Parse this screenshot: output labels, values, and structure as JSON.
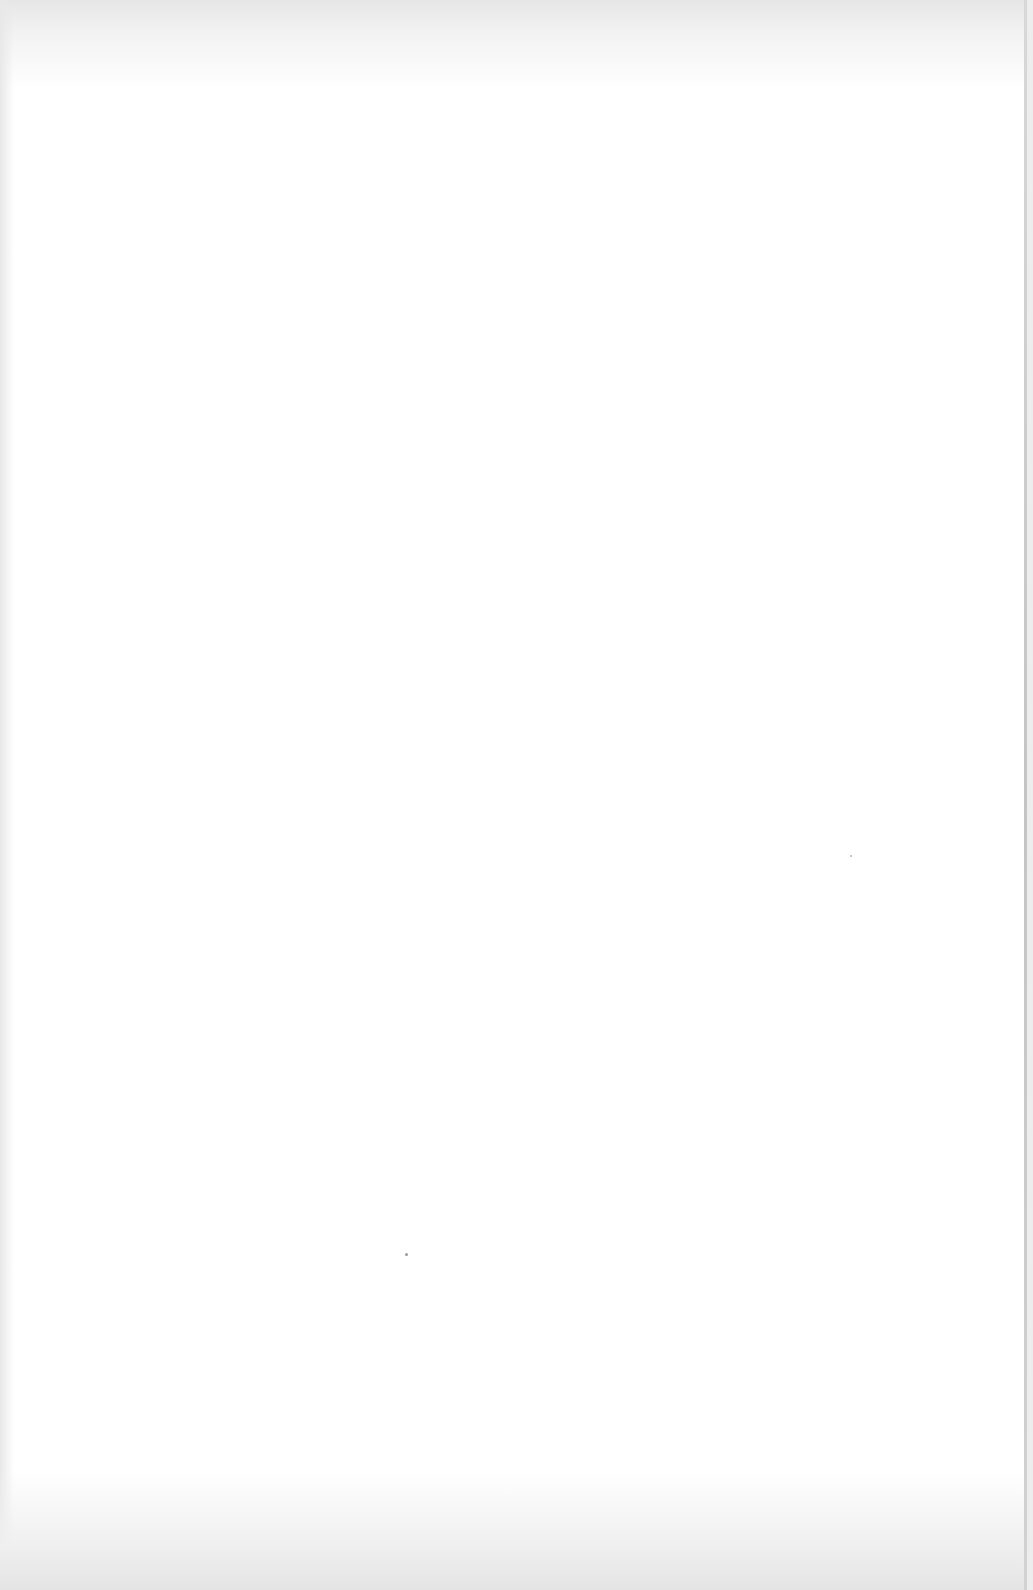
{
  "document": {
    "type": "blank-scanned-page",
    "text": "",
    "colors": {
      "paper": "#ffffff",
      "margin_shade": "#e6e6e6",
      "edge_line": "#c4c4c4"
    }
  }
}
